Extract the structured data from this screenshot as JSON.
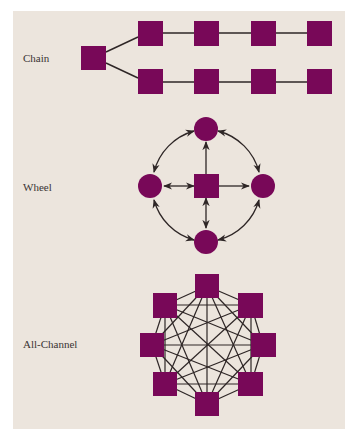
{
  "colors": {
    "background": "#ece5dd",
    "node": "#780858",
    "edge": "#2e2626"
  },
  "networks": [
    {
      "id": "chain",
      "label": "Chain",
      "node_shape": "square",
      "nodes": 9,
      "structure": "One root node branching into two linear chains of four nodes each"
    },
    {
      "id": "wheel",
      "label": "Wheel",
      "center_node_shape": "square",
      "outer_node_shape": "circle",
      "nodes": 5,
      "structure": "Central square connected to four outer circles; outer circles linked by curved two-way arrows"
    },
    {
      "id": "all-channel",
      "label": "All-Channel",
      "node_shape": "square",
      "nodes": 8,
      "structure": "Eight nodes in an octagon, every node connected to every other node"
    }
  ]
}
